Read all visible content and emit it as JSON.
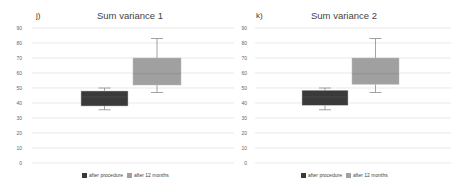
{
  "chart_data": [
    {
      "type": "box",
      "panel_label": "j)",
      "title": "Sum variance 1",
      "xlabel": "",
      "ylabel": "",
      "ylim": [
        0,
        90
      ],
      "yticks": [
        0,
        10,
        20,
        30,
        40,
        50,
        60,
        70,
        80,
        90
      ],
      "grid": true,
      "legend_position": "bottom",
      "series": [
        {
          "name": "after procedure",
          "color": "#3a3a3a",
          "min": 35.5,
          "q1": 38,
          "median": 44,
          "q3": 48,
          "max": 50
        },
        {
          "name": "after 12 months",
          "color": "#a0a0a0",
          "min": 47,
          "q1": 52,
          "median": 59.5,
          "q3": 70,
          "max": 83
        }
      ]
    },
    {
      "type": "box",
      "panel_label": "k)",
      "title": "Sum variance 2",
      "xlabel": "",
      "ylabel": "",
      "ylim": [
        0,
        90
      ],
      "yticks": [
        0,
        10,
        20,
        30,
        40,
        50,
        60,
        70,
        80,
        90
      ],
      "grid": true,
      "legend_position": "bottom",
      "series": [
        {
          "name": "after procedure",
          "color": "#3a3a3a",
          "min": 35.5,
          "q1": 38.5,
          "median": 44,
          "q3": 48.5,
          "max": 50
        },
        {
          "name": "after 12 months",
          "color": "#a0a0a0",
          "min": 47,
          "q1": 52.5,
          "median": 59.5,
          "q3": 70,
          "max": 83
        }
      ]
    }
  ]
}
